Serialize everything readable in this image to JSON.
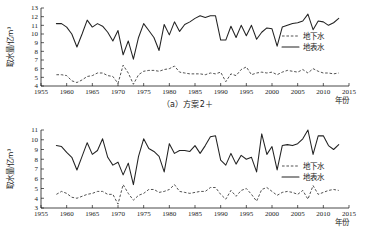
{
  "figure": {
    "panels": [
      {
        "id": "panel-a",
        "caption": "（a）方案2＋",
        "ylabel": "取水量/亿m³",
        "xlabel": "年份",
        "ylim": [
          4,
          13
        ],
        "yticks": [
          "4",
          "5",
          "6",
          "7",
          "8",
          "9",
          "10",
          "11",
          "12",
          "13"
        ],
        "xlim": [
          1955,
          2015
        ],
        "xticks": [
          "1955",
          "1960",
          "1965",
          "1970",
          "1975",
          "1980",
          "1985",
          "1990",
          "1995",
          "2000",
          "2005",
          "2010",
          "2015"
        ],
        "legend": [
          {
            "label": "地下水",
            "style": "dashed"
          },
          {
            "label": "地表水",
            "style": "solid"
          }
        ]
      },
      {
        "id": "panel-b",
        "caption": "（b）方案12",
        "ylabel": "取水量/亿m³",
        "xlabel": "年份",
        "ylim": [
          3,
          11
        ],
        "yticks": [
          "3",
          "4",
          "5",
          "6",
          "7",
          "8",
          "9",
          "10",
          "11"
        ],
        "xlim": [
          1955,
          2015
        ],
        "xticks": [
          "1955",
          "1960",
          "1965",
          "1970",
          "1975",
          "1980",
          "1985",
          "1990",
          "1995",
          "2000",
          "2005",
          "2010",
          "2015"
        ],
        "legend": [
          {
            "label": "地下水",
            "style": "dashed"
          },
          {
            "label": "地表水",
            "style": "solid"
          }
        ]
      }
    ]
  },
  "chart_data": [
    {
      "type": "line",
      "title": "（a）方案2＋",
      "xlabel": "年份",
      "ylabel": "取水量/亿m³",
      "xlim": [
        1955,
        2015
      ],
      "ylim": [
        4,
        13
      ],
      "grid": false,
      "legend_position": "right",
      "x": [
        1958,
        1959,
        1960,
        1961,
        1962,
        1963,
        1964,
        1965,
        1966,
        1967,
        1968,
        1969,
        1970,
        1971,
        1972,
        1973,
        1974,
        1975,
        1976,
        1977,
        1978,
        1979,
        1980,
        1981,
        1982,
        1983,
        1984,
        1985,
        1986,
        1987,
        1988,
        1989,
        1990,
        1991,
        1992,
        1993,
        1994,
        1995,
        1996,
        1997,
        1998,
        1999,
        2000,
        2001,
        2002,
        2003,
        2004,
        2005,
        2006,
        2007,
        2008,
        2009,
        2010,
        2011,
        2012,
        2013
      ],
      "series": [
        {
          "name": "地表水",
          "style": "solid",
          "values": [
            11.2,
            11.2,
            10.8,
            10.0,
            8.5,
            10.0,
            11.6,
            10.8,
            11.2,
            10.9,
            10.2,
            9.2,
            10.4,
            7.6,
            9.2,
            7.1,
            9.6,
            11.2,
            10.4,
            9.6,
            8.1,
            11.1,
            9.9,
            11.4,
            10.3,
            11.1,
            11.4,
            11.8,
            12.1,
            11.9,
            12.1,
            12.1,
            9.3,
            9.3,
            10.9,
            9.6,
            11.0,
            9.8,
            11.0,
            9.4,
            10.2,
            10.7,
            10.6,
            8.6,
            10.8,
            11.0,
            11.2,
            11.3,
            11.5,
            12.3,
            10.5,
            11.5,
            11.4,
            11.0,
            11.3,
            11.8
          ]
        },
        {
          "name": "地下水",
          "style": "dashed",
          "values": [
            5.3,
            5.3,
            5.2,
            4.6,
            4.4,
            4.7,
            5.1,
            5.2,
            5.5,
            5.5,
            5.2,
            5.1,
            4.3,
            6.4,
            5.5,
            4.2,
            5.3,
            5.7,
            5.8,
            5.8,
            5.7,
            5.9,
            6.0,
            6.3,
            5.6,
            5.5,
            5.4,
            5.4,
            5.4,
            5.3,
            5.5,
            5.4,
            5.6,
            4.5,
            5.4,
            5.2,
            5.9,
            6.2,
            5.3,
            5.5,
            5.6,
            5.5,
            5.6,
            5.3,
            5.6,
            5.8,
            5.7,
            5.6,
            5.9,
            5.5,
            6.0,
            5.7,
            5.5,
            5.5,
            5.4,
            5.5
          ]
        }
      ]
    },
    {
      "type": "line",
      "title": "（b）方案12",
      "xlabel": "年份",
      "ylabel": "取水量/亿m³",
      "xlim": [
        1955,
        2015
      ],
      "ylim": [
        3,
        11
      ],
      "grid": false,
      "legend_position": "right",
      "x": [
        1958,
        1959,
        1960,
        1961,
        1962,
        1963,
        1964,
        1965,
        1966,
        1967,
        1968,
        1969,
        1970,
        1971,
        1972,
        1973,
        1974,
        1975,
        1976,
        1977,
        1978,
        1979,
        1980,
        1981,
        1982,
        1983,
        1984,
        1985,
        1986,
        1987,
        1988,
        1989,
        1990,
        1991,
        1992,
        1993,
        1994,
        1995,
        1996,
        1997,
        1998,
        1999,
        2000,
        2001,
        2002,
        2003,
        2004,
        2005,
        2006,
        2007,
        2008,
        2009,
        2010,
        2011,
        2012,
        2013
      ],
      "series": [
        {
          "name": "地表水",
          "style": "solid",
          "values": [
            9.4,
            9.3,
            8.7,
            8.2,
            6.9,
            8.3,
            9.7,
            8.5,
            8.9,
            10.1,
            8.2,
            7.4,
            7.7,
            6.4,
            7.6,
            5.4,
            8.3,
            10.1,
            9.1,
            8.8,
            8.3,
            6.7,
            9.6,
            8.6,
            8.9,
            8.9,
            8.8,
            9.4,
            8.6,
            9.4,
            10.3,
            10.4,
            7.9,
            7.4,
            8.6,
            7.5,
            8.4,
            8.0,
            8.2,
            6.7,
            10.6,
            8.5,
            9.3,
            6.9,
            9.4,
            9.5,
            9.4,
            9.6,
            10.1,
            11.0,
            8.5,
            10.4,
            10.4,
            9.4,
            9.0,
            9.5
          ]
        },
        {
          "name": "地下水",
          "style": "dashed",
          "values": [
            4.4,
            4.7,
            4.5,
            4.1,
            4.0,
            4.2,
            4.4,
            4.5,
            4.7,
            4.7,
            4.4,
            4.4,
            3.4,
            5.4,
            4.5,
            3.8,
            4.3,
            4.5,
            4.9,
            4.9,
            4.6,
            4.7,
            4.9,
            5.4,
            4.7,
            4.6,
            4.5,
            4.6,
            4.7,
            4.7,
            5.1,
            5.1,
            4.4,
            3.9,
            4.8,
            4.2,
            4.8,
            5.0,
            4.4,
            3.7,
            4.9,
            5.1,
            4.7,
            4.3,
            4.6,
            4.7,
            4.6,
            4.4,
            4.8,
            3.9,
            5.3,
            4.4,
            4.6,
            4.8,
            4.9,
            4.8
          ]
        }
      ]
    }
  ]
}
